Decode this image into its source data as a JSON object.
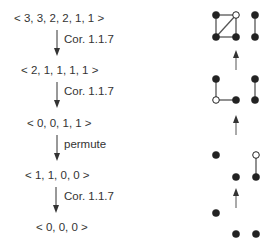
{
  "sequences": [
    {
      "text": "< 3, 3, 2, 2, 1, 1 >"
    },
    {
      "text": "< 2, 1, 1, 1, 1 >"
    },
    {
      "text": "< 0, 0, 1, 1 >"
    },
    {
      "text": "< 1, 1, 0, 0 >"
    },
    {
      "text": "< 0, 0, 0 >"
    }
  ],
  "steps": [
    {
      "label": "Cor. 1.1.7"
    },
    {
      "label": "Cor. 1.1.7"
    },
    {
      "label": "permute"
    },
    {
      "label": "Cor. 1.1.7"
    }
  ],
  "graphs": [
    {
      "nodes": [
        {
          "x": 216,
          "y": 15,
          "open": false
        },
        {
          "x": 236,
          "y": 15,
          "open": true
        },
        {
          "x": 216,
          "y": 37,
          "open": false
        },
        {
          "x": 236,
          "y": 37,
          "open": false
        },
        {
          "x": 255,
          "y": 15,
          "open": false
        },
        {
          "x": 255,
          "y": 37,
          "open": false
        }
      ],
      "edges": [
        [
          0,
          1
        ],
        [
          0,
          2
        ],
        [
          1,
          3
        ],
        [
          2,
          3
        ],
        [
          2,
          1
        ],
        [
          4,
          5
        ]
      ]
    },
    {
      "nodes": [
        {
          "x": 216,
          "y": 79,
          "open": false
        },
        {
          "x": 216,
          "y": 100,
          "open": true
        },
        {
          "x": 236,
          "y": 100,
          "open": false
        },
        {
          "x": 255,
          "y": 79,
          "open": false
        },
        {
          "x": 255,
          "y": 100,
          "open": false
        }
      ],
      "edges": [
        [
          0,
          1
        ],
        [
          1,
          2
        ],
        [
          3,
          4
        ]
      ]
    },
    {
      "nodes": [
        {
          "x": 216,
          "y": 155,
          "open": false
        },
        {
          "x": 256,
          "y": 155,
          "open": true
        },
        {
          "x": 236,
          "y": 177,
          "open": false
        },
        {
          "x": 256,
          "y": 177,
          "open": false
        }
      ],
      "edges": [
        [
          1,
          3
        ]
      ]
    },
    {
      "nodes": [
        {
          "x": 216,
          "y": 213,
          "open": false
        },
        {
          "x": 236,
          "y": 234,
          "open": false
        },
        {
          "x": 256,
          "y": 234,
          "open": false
        }
      ],
      "edges": []
    }
  ],
  "graph_arrows": [
    {
      "x": 236,
      "y1": 70,
      "y2": 50
    },
    {
      "x": 236,
      "y1": 135,
      "y2": 115
    },
    {
      "x": 236,
      "y1": 208,
      "y2": 188
    }
  ],
  "colors": {
    "ink": "#333333",
    "edge": "#555555",
    "node": "#222222"
  }
}
